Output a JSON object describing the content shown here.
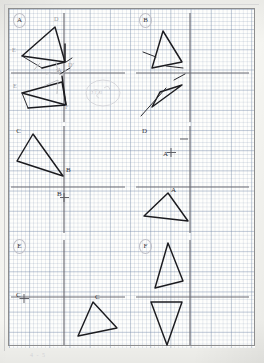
{
  "document": {
    "kind": "scanned-maths-worksheet",
    "title": "Reflections worksheet grid",
    "paper": "graph-paper",
    "bottom_scrawl": "4 - 5"
  },
  "colors": {
    "paper": "#f7f7f3",
    "grid_minor": "#c2cbdc",
    "grid_major": "#8c9bb4",
    "ink": "#1b1b1f",
    "axis": "#6a6a72",
    "faint_pencil": "#b8b9bd",
    "border": "#8d8d8d"
  },
  "panels": [
    {
      "id": "A",
      "label": "A",
      "circled": true,
      "origin": [
        64,
        73
      ],
      "axes": {
        "x_from": 11,
        "x_to": 125,
        "y_from": 13,
        "y_to": 122
      },
      "shapes": [
        {
          "name": "triangle-original-upper",
          "points": "22,56 55,27 65,62"
        },
        {
          "name": "triangle-image-upper",
          "points": "42,68 65,62 65,44"
        },
        {
          "name": "triangle-original-lower",
          "points": "22,93 62,82 66,105"
        },
        {
          "name": "triangle-image-lower",
          "points": "28,108 66,105 62,76"
        }
      ],
      "vertex_labels": [
        {
          "text": "D",
          "x": 54,
          "y": 19
        },
        {
          "text": "E",
          "x": 12,
          "y": 50
        },
        {
          "text": "D'",
          "x": 69,
          "y": 65
        },
        {
          "text": "A",
          "x": 58,
          "y": 73
        },
        {
          "text": "E",
          "x": 13,
          "y": 86
        },
        {
          "text": "F",
          "x": 66,
          "y": 107
        }
      ],
      "doodle": {
        "text": "5 r d",
        "x": 86,
        "y": 90
      }
    },
    {
      "id": "B",
      "label": "B",
      "circled": true,
      "origin": [
        190,
        73
      ],
      "axes": {
        "x_from": 136,
        "x_to": 249,
        "y_from": 13,
        "y_to": 122
      },
      "shapes": [
        {
          "name": "triangle-upper",
          "points": "152,68 163,31 182,62"
        },
        {
          "name": "triangle-lower",
          "points": "152,107 182,85 160,92"
        }
      ],
      "vertex_labels": []
    },
    {
      "id": "C",
      "label": "C",
      "circled": false,
      "origin": [
        64,
        187
      ],
      "axes": {
        "x_from": 11,
        "x_to": 125,
        "y_from": 126,
        "y_to": 233
      },
      "shapes": [
        {
          "name": "triangle",
          "points": "33,134 17,161 63,176"
        }
      ],
      "vertex_labels": [
        {
          "text": "B",
          "x": 66,
          "y": 170
        }
      ],
      "point_markers": [
        {
          "name": "point-B-marker",
          "label": "B",
          "x": 68,
          "y": 197
        }
      ]
    },
    {
      "id": "D",
      "label": "D",
      "circled": false,
      "origin": [
        190,
        187
      ],
      "axes": {
        "x_from": 136,
        "x_to": 249,
        "y_from": 126,
        "y_to": 233
      },
      "shapes": [
        {
          "name": "triangle",
          "points": "168,193 144,216 188,221"
        }
      ],
      "vertex_labels": [
        {
          "text": "A",
          "x": 172,
          "y": 190
        }
      ],
      "point_markers": [
        {
          "name": "point-A-marker",
          "label": "A",
          "x": 170,
          "y": 157
        }
      ]
    },
    {
      "id": "E",
      "label": "E",
      "circled": true,
      "origin": [
        64,
        297
      ],
      "axes": {
        "x_from": 11,
        "x_to": 125,
        "y_from": 240,
        "y_to": 345
      },
      "shapes": [
        {
          "name": "triangle",
          "points": "93,302 78,336 117,328"
        }
      ],
      "vertex_labels": [
        {
          "text": "C",
          "x": 96,
          "y": 297
        }
      ],
      "point_markers": [
        {
          "name": "point-C-marker",
          "label": "C",
          "x": 20,
          "y": 297
        }
      ]
    },
    {
      "id": "F",
      "label": "F",
      "circled": true,
      "origin": [
        190,
        297
      ],
      "axes": {
        "x_from": 136,
        "x_to": 249,
        "y_from": 240,
        "y_to": 345
      },
      "shapes": [
        {
          "name": "triangle-above-axis",
          "points": "168,243 155,288 183,281"
        },
        {
          "name": "triangle-below-axis",
          "points": "151,302 182,302 167,345"
        }
      ],
      "vertex_labels": []
    }
  ]
}
